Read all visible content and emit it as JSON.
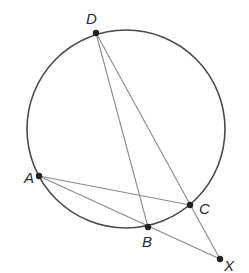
{
  "figure": {
    "type": "circle-secants",
    "circle": {
      "cx": 126,
      "cy": 129,
      "r": 99,
      "stroke": "#4a4a4a"
    },
    "points": [
      {
        "id": "D",
        "label": "D",
        "x": 96,
        "y": 33,
        "lx": 86,
        "ly": 24
      },
      {
        "id": "A",
        "label": "A",
        "x": 39,
        "y": 176,
        "lx": 24,
        "ly": 183
      },
      {
        "id": "C",
        "label": "C",
        "x": 190,
        "y": 205,
        "lx": 199,
        "ly": 214
      },
      {
        "id": "B",
        "label": "B",
        "x": 148,
        "y": 227,
        "lx": 142,
        "ly": 247
      },
      {
        "id": "X",
        "label": "X",
        "x": 220,
        "y": 259,
        "lx": 224,
        "ly": 271
      }
    ],
    "segments": [
      [
        "D",
        "B"
      ],
      [
        "D",
        "X"
      ],
      [
        "A",
        "C"
      ],
      [
        "A",
        "X"
      ]
    ],
    "line_color": "#8a8a8a",
    "point_color": "#222222"
  }
}
